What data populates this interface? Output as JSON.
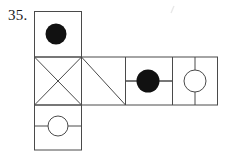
{
  "figure": {
    "problem_number": "35.",
    "type": "cube-net-diagram",
    "stroke_color": "#4a4a4a",
    "fill_color": "#111111",
    "background_color": "#ffffff",
    "line_width": 1,
    "geometry": {
      "left": 34,
      "right": 218,
      "top_square": {
        "x": 34,
        "y": 11,
        "w": 48,
        "h": 46
      },
      "middle_row": {
        "x": 34,
        "y": 57,
        "w": 184,
        "h": 48
      },
      "bottom_square": {
        "x": 34,
        "y": 105,
        "w": 48,
        "h": 45
      },
      "middle_dividers": [
        82,
        125,
        172
      ],
      "bottom_divider_y": 126
    },
    "cells": [
      {
        "name": "top-square",
        "position": "top",
        "content": "filled-circle",
        "circle": {
          "cx": 56,
          "cy": 34,
          "r": 10,
          "fill": "#111111"
        },
        "lines": []
      },
      {
        "name": "middle-cell-1",
        "position": "middle-1",
        "content": "x-cross",
        "circle": null,
        "lines": [
          "diagonal-tl-br",
          "diagonal-tr-bl"
        ]
      },
      {
        "name": "middle-cell-2",
        "position": "middle-2",
        "content": "single-diagonal",
        "circle": null,
        "lines": [
          "diagonal-tl-br"
        ]
      },
      {
        "name": "middle-cell-3",
        "position": "middle-3",
        "content": "filled-circle-with-horizontal-line",
        "circle": {
          "cx": 148,
          "cy": 81,
          "r": 11,
          "fill": "#111111"
        },
        "lines": [
          "horizontal-midline"
        ]
      },
      {
        "name": "middle-cell-4",
        "position": "middle-4",
        "content": "open-circle-with-vertical-line",
        "circle": {
          "cx": 195,
          "cy": 81,
          "r": 11,
          "fill": "none"
        },
        "lines": [
          "vertical-midline"
        ]
      },
      {
        "name": "bottom-square",
        "position": "bottom",
        "content": "open-circle-with-horizontal-line",
        "circle": {
          "cx": 58,
          "cy": 126,
          "r": 10,
          "fill": "none"
        },
        "lines": [
          "horizontal-midline"
        ]
      }
    ],
    "artifact": {
      "name": "scan-speck",
      "x": 172,
      "y": 9,
      "visible": true
    }
  }
}
